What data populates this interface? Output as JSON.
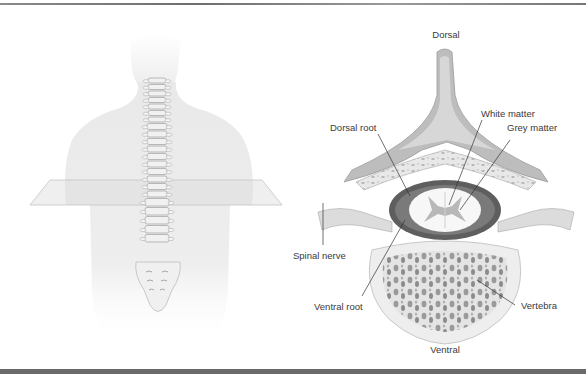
{
  "figure": {
    "left_panel": {
      "description": "Human back with spine and transverse plane"
    },
    "right_panel": {
      "description": "Transverse section of spinal cord within vertebra",
      "labels": {
        "dorsal": "Dorsal",
        "white_matter": "White matter",
        "dorsal_root": "Dorsal root",
        "grey_matter": "Grey matter",
        "spinal_nerve": "Spinal nerve",
        "ventral_root": "Ventral root",
        "vertebra": "Vertebra",
        "ventral": "Ventral"
      }
    },
    "colors": {
      "rule": "#6a6a6a",
      "bone": "#e6e6e6",
      "dura": "#5e5e5e",
      "label": "#3a3a3a"
    }
  }
}
